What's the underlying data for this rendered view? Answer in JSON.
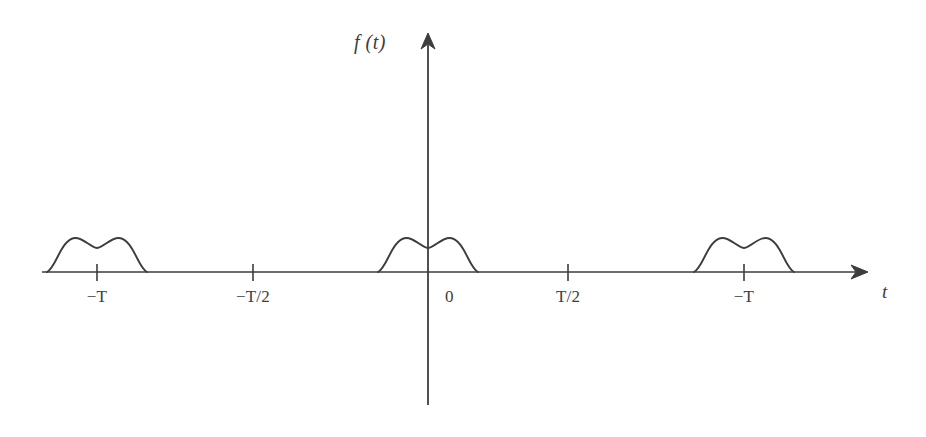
{
  "figure": {
    "kind": "signal-waveform-plot",
    "background_color": "#ffffff",
    "stroke_color": "#3d3d3d",
    "function_label": "f (t)",
    "axis_label_x": "t"
  },
  "axes": {
    "x_axis": {
      "label": "t",
      "baseline_y": 272,
      "start_x": 42,
      "end_x": 866,
      "arrow": "right"
    },
    "y_axis": {
      "label": "f (t)",
      "axis_x": 428,
      "top_y": 35,
      "bottom_y": 405,
      "arrow": "up"
    }
  },
  "ticks": [
    {
      "label": "−T",
      "x": 97,
      "has_tick": true
    },
    {
      "label": "−T/2",
      "x": 253,
      "has_tick": true
    },
    {
      "label": "0",
      "x": 428,
      "has_tick": false
    },
    {
      "label": "T/2",
      "x": 568,
      "has_tick": true
    },
    {
      "label": "−T",
      "x": 744,
      "has_tick": true
    }
  ],
  "chart_data": {
    "type": "line",
    "title": "",
    "xlabel": "t",
    "ylabel": "f (t)",
    "grid": false,
    "legend": null,
    "xlim": [
      42,
      866
    ],
    "ylim": [
      272,
      232
    ],
    "pulse": {
      "half_width": 50,
      "peak_height": 34,
      "dip_height": 24,
      "shoulder_offset": 22
    },
    "pulse_centers": [
      97,
      428,
      744
    ],
    "tick_labels": [
      "−T",
      "−T/2",
      "0",
      "T/2",
      "−T"
    ],
    "tick_positions": [
      97,
      253,
      428,
      568,
      744
    ],
    "series": [
      {
        "name": "f(t)",
        "points": [
          [
            42,
            272
          ],
          [
            55,
            272
          ],
          [
            60,
            266
          ],
          [
            65,
            256
          ],
          [
            71,
            246
          ],
          [
            78,
            240
          ],
          [
            85,
            238
          ],
          [
            92,
            239
          ],
          [
            97,
            243
          ],
          [
            103,
            247
          ],
          [
            109,
            248
          ],
          [
            116,
            245
          ],
          [
            123,
            240
          ],
          [
            130,
            238
          ],
          [
            137,
            239
          ],
          [
            143,
            245
          ],
          [
            148,
            255
          ],
          [
            153,
            265
          ],
          [
            156,
            272
          ],
          [
            253,
            272
          ],
          [
            382,
            272
          ],
          [
            386,
            266
          ],
          [
            391,
            256
          ],
          [
            397,
            246
          ],
          [
            404,
            240
          ],
          [
            411,
            238
          ],
          [
            418,
            239
          ],
          [
            424,
            243
          ],
          [
            430,
            247
          ],
          [
            436,
            248
          ],
          [
            443,
            245
          ],
          [
            450,
            240
          ],
          [
            457,
            238
          ],
          [
            464,
            239
          ],
          [
            470,
            245
          ],
          [
            475,
            255
          ],
          [
            480,
            265
          ],
          [
            483,
            272
          ],
          [
            568,
            272
          ],
          [
            696,
            272
          ],
          [
            700,
            266
          ],
          [
            706,
            256
          ],
          [
            712,
            246
          ],
          [
            719,
            240
          ],
          [
            726,
            238
          ],
          [
            733,
            239
          ],
          [
            740,
            243
          ],
          [
            746,
            247
          ],
          [
            752,
            248
          ],
          [
            759,
            245
          ],
          [
            766,
            240
          ],
          [
            773,
            238
          ],
          [
            780,
            239
          ],
          [
            786,
            245
          ],
          [
            791,
            255
          ],
          [
            796,
            265
          ],
          [
            799,
            272
          ],
          [
            866,
            272
          ]
        ]
      }
    ]
  }
}
